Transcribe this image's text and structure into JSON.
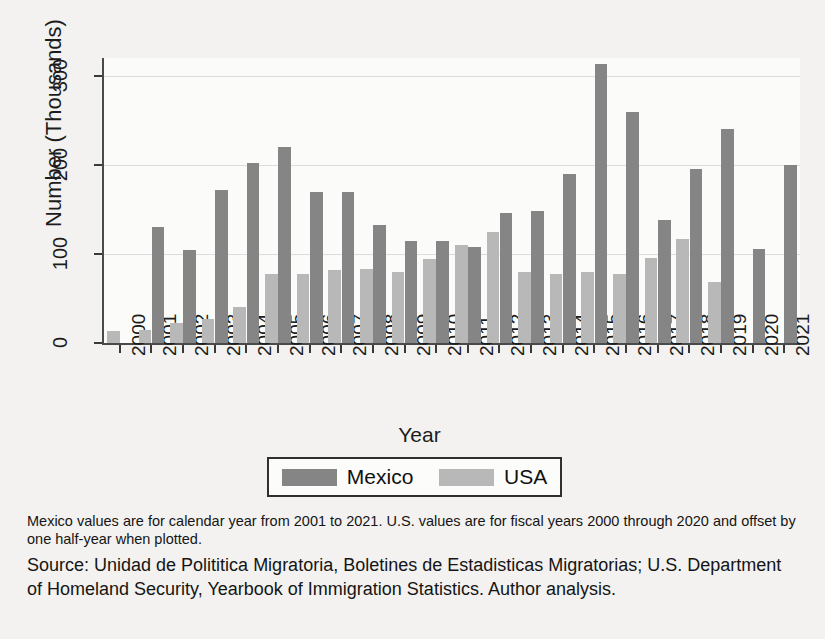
{
  "chart_data": {
    "type": "bar",
    "title": "",
    "xlabel": "Year",
    "ylabel": "Number (Thousands)",
    "ylim": [
      0,
      320
    ],
    "yticks": [
      0,
      100,
      200,
      300
    ],
    "grid": true,
    "legend_position": "bottom",
    "categories": [
      "2000",
      "2001",
      "2002",
      "2003",
      "2004",
      "2005",
      "2006",
      "2007",
      "2008",
      "2009",
      "2010",
      "2011",
      "2012",
      "2013",
      "2014",
      "2015",
      "2016",
      "2017",
      "2018",
      "2019",
      "2020",
      "2021"
    ],
    "series": [
      {
        "name": "Mexico",
        "color": "#858585",
        "note": "calendar years 2001-2021",
        "values": [
          null,
          130,
          104,
          172,
          202,
          220,
          170,
          170,
          133,
          115,
          115,
          108,
          146,
          148,
          190,
          313,
          259,
          138,
          195,
          240,
          106,
          200
        ]
      },
      {
        "name": "USA",
        "color": "#b8b8b8",
        "note": "fiscal years 2000-2020, offset by one half-year when plotted",
        "values": [
          14,
          15,
          23,
          27,
          40,
          78,
          78,
          82,
          83,
          80,
          94,
          110,
          125,
          80,
          77,
          80,
          78,
          95,
          117,
          68,
          null,
          null
        ]
      }
    ]
  },
  "legend": {
    "items": [
      {
        "label": "Mexico",
        "color": "#858585"
      },
      {
        "label": "USA",
        "color": "#b8b8b8"
      }
    ]
  },
  "notes": {
    "footnote": "Mexico values are for calendar year from 2001 to 2021. U.S. values are for fiscal years 2000 through 2020 and offset by one half-year when plotted.",
    "source": "Source: Unidad de Polititica Migratoria, Boletines de Estadisticas Migratorias; U.S. Department of Homeland Security, Yearbook of Immigration Statistics. Author analysis."
  }
}
